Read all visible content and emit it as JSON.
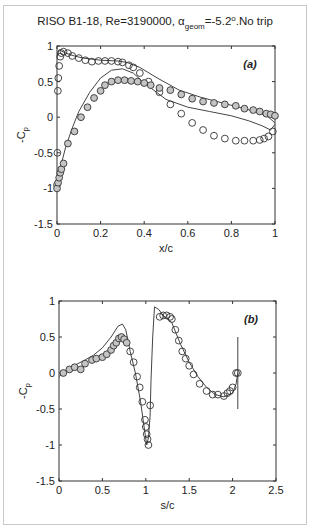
{
  "title": {
    "main": "RISO B1-18, Re=3190000, α",
    "sub": "geom",
    "rest": "=-5.2",
    "sup": "o",
    "tail": ".No trip"
  },
  "chart_data": [
    {
      "type": "line",
      "panel_label": "(a)",
      "xlabel": "x/c",
      "ylabel": "-C",
      "ylabel_sub": "p",
      "xlim": [
        0,
        1
      ],
      "ylim": [
        -1.5,
        1
      ],
      "xticks": [
        "0",
        "0.2",
        "0.4",
        "0.6",
        "0.8",
        "1"
      ],
      "yticks": [
        "1",
        "0.5",
        "0",
        "-0.5",
        "-1",
        "-1.5"
      ],
      "grid": false,
      "series": [
        {
          "name": "computed upper",
          "style": "line",
          "x": [
            0.0,
            0.005,
            0.01,
            0.02,
            0.04,
            0.08,
            0.12,
            0.2,
            0.28,
            0.32,
            0.38,
            0.46,
            0.56,
            0.66,
            0.76,
            0.86,
            0.93,
            0.97,
            1.0
          ],
          "y": [
            0.85,
            0.92,
            0.95,
            0.93,
            0.9,
            0.86,
            0.83,
            0.8,
            0.79,
            0.77,
            0.7,
            0.55,
            0.38,
            0.28,
            0.2,
            0.12,
            0.06,
            0.0,
            -0.08
          ]
        },
        {
          "name": "computed lower",
          "style": "line",
          "x": [
            0.0,
            0.01,
            0.02,
            0.04,
            0.07,
            0.1,
            0.15,
            0.2,
            0.25,
            0.3,
            0.35,
            0.4,
            0.5,
            0.6,
            0.7,
            0.8,
            0.88,
            0.94,
            0.98,
            1.0
          ],
          "y": [
            -1.0,
            -0.85,
            -0.65,
            -0.42,
            -0.15,
            0.08,
            0.35,
            0.55,
            0.66,
            0.68,
            0.62,
            0.48,
            0.25,
            0.14,
            0.08,
            0.02,
            -0.05,
            -0.12,
            -0.18,
            -0.1
          ],
          "note": "dashed drawn as second leg of the loop (pressure side / suction side)"
        },
        {
          "name": "experiment suction side",
          "style": "open-circle",
          "x": [
            0.0,
            0.002,
            0.004,
            0.006,
            0.01,
            0.015,
            0.02,
            0.03,
            0.05,
            0.07,
            0.1,
            0.13,
            0.16,
            0.19,
            0.22,
            0.25,
            0.28,
            0.3,
            0.33,
            0.35,
            0.38,
            0.42,
            0.47,
            0.52,
            0.57,
            0.62,
            0.67,
            0.72,
            0.77,
            0.82,
            0.86,
            0.9,
            0.93,
            0.95,
            0.97,
            0.99
          ],
          "y": [
            -0.95,
            -0.5,
            0.37,
            0.55,
            0.72,
            0.85,
            0.9,
            0.92,
            0.9,
            0.86,
            0.83,
            0.8,
            0.78,
            0.79,
            0.79,
            0.79,
            0.78,
            0.77,
            0.73,
            0.7,
            0.62,
            0.5,
            0.35,
            0.18,
            0.05,
            -0.08,
            -0.18,
            -0.26,
            -0.3,
            -0.33,
            -0.33,
            -0.33,
            -0.32,
            -0.3,
            -0.27,
            -0.2
          ]
        },
        {
          "name": "experiment pressure side",
          "style": "filled-circle",
          "x": [
            0.0,
            0.005,
            0.01,
            0.015,
            0.02,
            0.03,
            0.05,
            0.08,
            0.11,
            0.14,
            0.17,
            0.2,
            0.22,
            0.25,
            0.28,
            0.31,
            0.34,
            0.37,
            0.4,
            0.43,
            0.47,
            0.52,
            0.57,
            0.62,
            0.67,
            0.72,
            0.77,
            0.82,
            0.86,
            0.9,
            0.93,
            0.96,
            0.98,
            1.0
          ],
          "y": [
            -1.0,
            -0.92,
            -0.85,
            -0.78,
            -0.73,
            -0.65,
            -0.37,
            -0.2,
            0.0,
            0.14,
            0.27,
            0.37,
            0.45,
            0.5,
            0.52,
            0.52,
            0.51,
            0.5,
            0.48,
            0.45,
            0.41,
            0.38,
            0.32,
            0.26,
            0.22,
            0.2,
            0.18,
            0.16,
            0.12,
            0.1,
            0.08,
            0.05,
            0.04,
            0.02
          ]
        }
      ]
    },
    {
      "type": "line",
      "panel_label": "(b)",
      "xlabel": "s/c",
      "ylabel": "-C",
      "ylabel_sub": "p",
      "xlim": [
        0,
        2.5
      ],
      "ylim": [
        -1.5,
        1
      ],
      "xticks": [
        "0",
        "0.5",
        "1",
        "1.5",
        "2",
        "2.5"
      ],
      "yticks": [
        "1",
        "0.5",
        "0",
        "-0.5",
        "-1",
        "-1.5"
      ],
      "grid": false,
      "series": [
        {
          "name": "computed",
          "style": "line",
          "x": [
            0.0,
            0.1,
            0.2,
            0.3,
            0.4,
            0.5,
            0.6,
            0.68,
            0.73,
            0.77,
            0.82,
            0.88,
            0.94,
            0.98,
            1.01,
            1.03,
            1.05,
            1.06,
            1.08,
            1.1,
            1.15,
            1.2,
            1.3,
            1.4,
            1.5,
            1.6,
            1.7,
            1.8,
            1.9,
            2.0,
            2.04,
            2.06
          ],
          "y": [
            -0.05,
            0.05,
            0.12,
            0.18,
            0.25,
            0.35,
            0.5,
            0.65,
            0.68,
            0.6,
            0.3,
            0.0,
            -0.4,
            -0.75,
            -1.0,
            -0.9,
            -0.6,
            -0.1,
            0.5,
            0.92,
            0.88,
            0.8,
            0.7,
            0.4,
            0.15,
            -0.05,
            -0.2,
            -0.3,
            -0.33,
            -0.28,
            -0.15,
            0.0
          ]
        },
        {
          "name": "computed TE line",
          "style": "line",
          "x": [
            2.06,
            2.06
          ],
          "y": [
            0.5,
            -0.5
          ]
        },
        {
          "name": "experiment",
          "style": "open-circle",
          "x": [
            0.05,
            0.12,
            0.18,
            0.25,
            0.3,
            0.38,
            0.43,
            0.5,
            0.55,
            0.6,
            0.63,
            0.66,
            0.69,
            0.72,
            0.75,
            0.78,
            0.82,
            0.86,
            0.9,
            0.93,
            0.96,
            0.99,
            1.0,
            1.01,
            1.02,
            1.03,
            1.05,
            1.16,
            1.2,
            1.24,
            1.28,
            1.3,
            1.34,
            1.38,
            1.42,
            1.46,
            1.5,
            1.55,
            1.62,
            1.7,
            1.77,
            1.83,
            1.9,
            1.94,
            1.97,
            2.0,
            2.04,
            2.06
          ],
          "y": [
            0.0,
            0.05,
            0.08,
            0.05,
            0.13,
            0.18,
            0.2,
            0.22,
            0.26,
            0.32,
            0.38,
            0.42,
            0.48,
            0.5,
            0.47,
            0.42,
            0.3,
            0.15,
            -0.05,
            -0.2,
            -0.4,
            -0.65,
            -0.75,
            -0.85,
            -0.92,
            -1.0,
            -0.45,
            0.78,
            0.8,
            0.8,
            0.78,
            0.75,
            0.6,
            0.45,
            0.3,
            0.2,
            0.1,
            -0.02,
            -0.15,
            -0.25,
            -0.3,
            -0.3,
            -0.32,
            -0.28,
            -0.25,
            -0.2,
            0.0,
            0.0
          ],
          "note": "pressure-side points drawn filled (s/c < 1.05)"
        }
      ]
    }
  ]
}
